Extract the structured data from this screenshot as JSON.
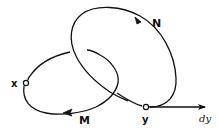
{
  "diagram": {
    "type": "path-loop diagram",
    "colors": {
      "stroke": "#111111",
      "background": "#ffffff"
    },
    "points": {
      "x": {
        "label": "x",
        "cx": 26,
        "cy": 83
      },
      "y": {
        "label": "y",
        "cx": 146,
        "cy": 107
      }
    },
    "loops": {
      "N": {
        "label": "N",
        "direction": "counter-clockwise",
        "passes_through": "y"
      },
      "M": {
        "label": "M",
        "direction": "clockwise",
        "passes_through": "x"
      }
    },
    "vector": {
      "label": "dy",
      "from": "y",
      "direction": "right"
    }
  }
}
